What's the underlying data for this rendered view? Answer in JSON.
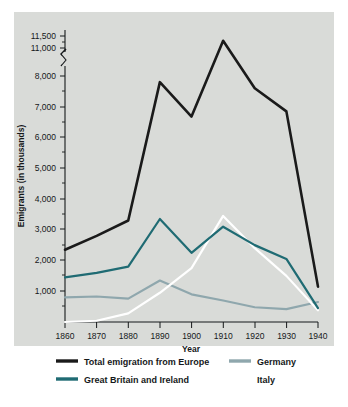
{
  "chart_data": {
    "type": "line",
    "title": "",
    "xlabel": "Year",
    "ylabel": "Emigrants (in thousands)",
    "x": [
      1860,
      1870,
      1880,
      1890,
      1900,
      1910,
      1920,
      1930,
      1940
    ],
    "xticklabels": [
      "1860",
      "1870",
      "1880",
      "1890",
      "1900",
      "1910",
      "1920",
      "1930",
      "1940"
    ],
    "xlim": [
      1860,
      1940
    ],
    "yticklabels": [
      "1,000",
      "2,000",
      "3,000",
      "4,000",
      "5,000",
      "6,000",
      "7,000",
      "8,000",
      "11,000",
      "11,500"
    ],
    "ytickvalues": [
      1000,
      2000,
      3000,
      4000,
      5000,
      6000,
      7000,
      8000,
      11000,
      11500
    ],
    "ylim": [
      0,
      11500
    ],
    "axis_break": {
      "present": true,
      "between": [
        8000,
        11000
      ],
      "note": "broken y-axis between 8,000 and 11,000"
    },
    "grid": false,
    "legend_position": "below",
    "series": [
      {
        "name": "Total emigration from Europe",
        "color": "#1a1a1a",
        "values": [
          2350,
          2800,
          3300,
          7800,
          6680,
          11300,
          7600,
          6850,
          1150
        ]
      },
      {
        "name": "Great Britain and Ireland",
        "color": "#1f6b73",
        "values": [
          1450,
          1600,
          1800,
          3350,
          2250,
          3100,
          2500,
          2050,
          450
        ]
      },
      {
        "name": "Germany",
        "color": "#8fa7ad",
        "values": [
          800,
          830,
          760,
          1350,
          900,
          700,
          480,
          420,
          650
        ]
      },
      {
        "name": "Italy",
        "color": "#ffffff",
        "values": [
          0,
          40,
          280,
          950,
          1750,
          3450,
          2400,
          1500,
          380
        ]
      }
    ]
  },
  "legend": {
    "items": [
      {
        "label": "Total emigration from Europe",
        "color": "#1a1a1a"
      },
      {
        "label": "Great Britain and Ireland",
        "color": "#1f6b73"
      },
      {
        "label": "Germany",
        "color": "#8fa7ad"
      },
      {
        "label": "Italy",
        "color": "#ffffff"
      }
    ]
  },
  "colors": {
    "panel_background": "#d9dbd8",
    "page_background": "#ffffff",
    "axis": "#15181a",
    "text": "#15181a"
  }
}
